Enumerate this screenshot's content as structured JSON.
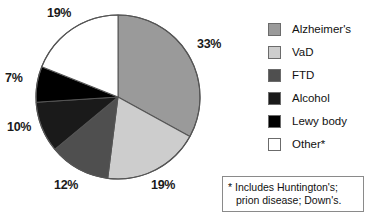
{
  "chart_data": {
    "type": "pie",
    "title": "",
    "categories": [
      "Alzheimer's",
      "VaD",
      "FTD",
      "Alcohol",
      "Lewy body",
      "Other*"
    ],
    "values": [
      33,
      19,
      12,
      10,
      7,
      19
    ],
    "value_labels": [
      "33%",
      "19%",
      "12%",
      "10%",
      "7%",
      "19%"
    ],
    "unit": "%",
    "start_angle_deg": 0,
    "direction": "clockwise",
    "legend_position": "right",
    "grid": false,
    "slice_colors": [
      "#9a9a9a",
      "#cdcdcd",
      "#4f4f4f",
      "#1a1a1a",
      "#000000",
      "#ffffff"
    ],
    "slice_border_color": "#555555",
    "annotations": [
      "* Includes Huntington's; prion disease; Down's."
    ]
  },
  "pie": {
    "slices": [
      {
        "label": "Alzheimer's",
        "percent_label": "33%",
        "value": 33,
        "color": "#9a9a9a"
      },
      {
        "label": "VaD",
        "percent_label": "19%",
        "value": 19,
        "color": "#cdcdcd"
      },
      {
        "label": "FTD",
        "percent_label": "12%",
        "value": 12,
        "color": "#4f4f4f"
      },
      {
        "label": "Alcohol",
        "percent_label": "10%",
        "value": 10,
        "color": "#1a1a1a"
      },
      {
        "label": "Lewy body",
        "percent_label": "7%",
        "value": 7,
        "color": "#000000"
      },
      {
        "label": "Other*",
        "percent_label": "19%",
        "value": 19,
        "color": "#ffffff"
      }
    ]
  },
  "legend": {
    "items": [
      {
        "label": "Alzheimer's",
        "color": "#9a9a9a"
      },
      {
        "label": "VaD",
        "color": "#cdcdcd"
      },
      {
        "label": "FTD",
        "color": "#4f4f4f"
      },
      {
        "label": "Alcohol",
        "color": "#1a1a1a"
      },
      {
        "label": "Lewy body",
        "color": "#000000"
      },
      {
        "label": "Other*",
        "color": "#ffffff"
      }
    ]
  },
  "footnote": {
    "line1": "* Includes Huntington's;",
    "line2": "prion disease; Down's."
  }
}
